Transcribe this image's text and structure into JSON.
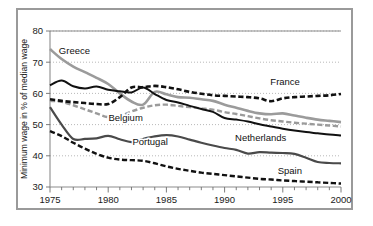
{
  "figure": {
    "border_color": "#9a9a9a",
    "background": "#ffffff"
  },
  "chart_data": {
    "type": "line",
    "title": "",
    "subtitle": "",
    "xlabel": "",
    "ylabel": "Minimum wage in % of median wage",
    "xlim": [
      1975,
      2000
    ],
    "ylim": [
      30,
      80
    ],
    "ytick_labels": [
      "30",
      "40",
      "50",
      "60",
      "70",
      "80"
    ],
    "yticks": [
      30,
      40,
      50,
      60,
      70,
      80
    ],
    "xtick_labels": [
      "1975",
      "1980",
      "1985",
      "1990",
      "1995",
      "2000"
    ],
    "xticks": [
      1975,
      1980,
      1985,
      1990,
      1995,
      2000
    ],
    "minor_xtick_interval": 1,
    "grid": "horizontal-dotted",
    "legend": "inline-labels",
    "x": [
      1975,
      1976,
      1977,
      1978,
      1979,
      1980,
      1981,
      1982,
      1983,
      1984,
      1985,
      1986,
      1987,
      1988,
      1989,
      1990,
      1991,
      1992,
      1993,
      1994,
      1995,
      1996,
      1997,
      1998,
      1999,
      2000
    ],
    "series": [
      {
        "name": "Greece",
        "color": "#9b9b9b",
        "style": "solid",
        "width": 2.6,
        "label_x": 1977.1,
        "label_y": 72.6,
        "values": [
          74.2,
          71.0,
          68.6,
          66.8,
          65.0,
          63.0,
          60.0,
          57.4,
          56.4,
          60.5,
          59.7,
          58.8,
          58.6,
          58.1,
          57.6,
          56.4,
          55.4,
          54.4,
          53.6,
          53.3,
          53.6,
          52.9,
          52.2,
          51.6,
          51.2,
          50.8
        ]
      },
      {
        "name": "Netherlands",
        "color": "#111111",
        "style": "solid",
        "width": 2.0,
        "label_x": 1993.1,
        "label_y": 44.8,
        "values": [
          62.6,
          64.1,
          62.3,
          61.6,
          62.2,
          61.2,
          60.7,
          60.3,
          61.9,
          59.8,
          57.9,
          57.1,
          56.0,
          55.0,
          54.1,
          52.1,
          51.6,
          51.0,
          50.1,
          49.4,
          48.7,
          48.1,
          47.6,
          47.2,
          46.8,
          46.5
        ]
      },
      {
        "name": "France",
        "color": "#111111",
        "style": "dashed",
        "width": 2.6,
        "label_x": 1995.2,
        "label_y": 62.6,
        "values": [
          58.1,
          57.6,
          57.2,
          56.9,
          56.6,
          56.6,
          58.8,
          61.9,
          62.0,
          62.4,
          62.0,
          61.3,
          60.5,
          59.9,
          59.4,
          59.2,
          59.0,
          58.8,
          58.4,
          57.5,
          58.4,
          58.8,
          59.0,
          59.2,
          59.4,
          59.8
        ]
      },
      {
        "name": "Belgium",
        "color": "#9b9b9b",
        "style": "dashed",
        "width": 2.4,
        "label_x": 1981.5,
        "label_y": 51.2,
        "values": [
          57.6,
          57.3,
          56.2,
          54.9,
          53.6,
          52.4,
          52.8,
          54.2,
          55.4,
          56.2,
          56.4,
          56.0,
          55.6,
          55.2,
          54.8,
          54.0,
          53.4,
          52.7,
          52.0,
          51.4,
          51.0,
          50.6,
          50.3,
          50.0,
          49.7,
          49.4
        ]
      },
      {
        "name": "Portugal",
        "color": "#4a4a4a",
        "style": "solid",
        "width": 2.2,
        "label_x": 1983.6,
        "label_y": 43.5,
        "values": [
          55.6,
          50.0,
          45.4,
          45.4,
          45.6,
          46.4,
          45.3,
          44.4,
          45.4,
          46.2,
          46.6,
          46.2,
          45.2,
          44.2,
          43.3,
          42.5,
          41.9,
          40.7,
          41.2,
          41.0,
          40.9,
          40.6,
          39.4,
          38.0,
          37.7,
          37.6
        ]
      },
      {
        "name": "Spain",
        "color": "#111111",
        "style": "dashed",
        "width": 2.4,
        "label_x": 1995.6,
        "label_y": 34.2,
        "values": [
          47.9,
          46.3,
          44.2,
          42.3,
          40.6,
          39.4,
          38.8,
          38.6,
          38.4,
          37.6,
          36.6,
          35.8,
          35.2,
          34.6,
          34.2,
          33.8,
          33.4,
          33.0,
          32.6,
          32.4,
          32.1,
          31.9,
          31.7,
          31.5,
          31.3,
          31.1
        ]
      }
    ]
  }
}
